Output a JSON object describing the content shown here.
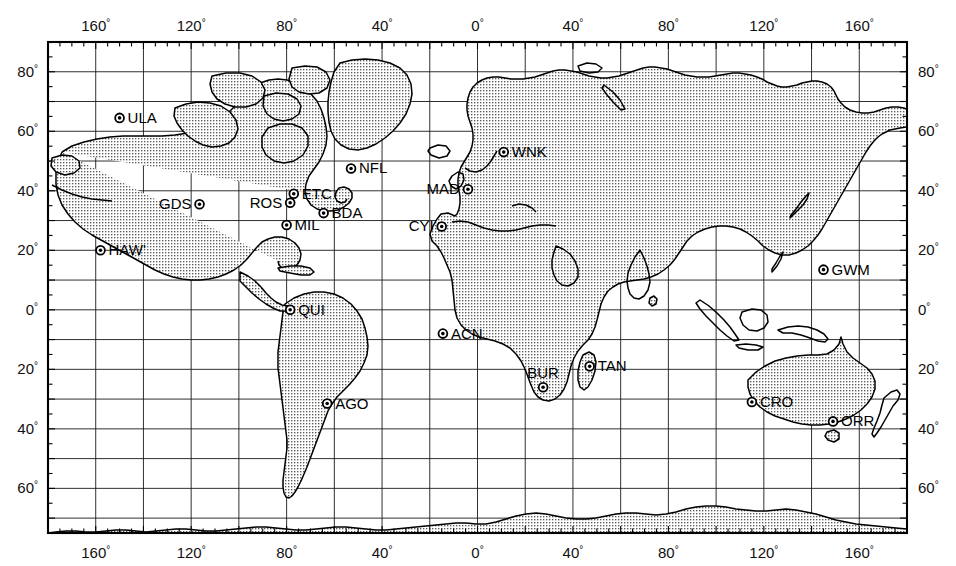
{
  "figure": {
    "type": "world-map",
    "projection": "equirectangular",
    "title": "",
    "background_color": "#ffffff",
    "land_fill_pattern": "stipple",
    "line_color": "#000000"
  },
  "axes": {
    "x_label_suffix": "°",
    "y_label_suffix": "°",
    "x_range": [
      -180,
      180
    ],
    "y_range": [
      -75,
      90
    ],
    "x_gridline_interval_deg": 20,
    "x_major_label_interval_deg": 40,
    "y_gridline_interval_deg": 10,
    "y_major_label_interval_deg": 20,
    "minor_tick_interval_deg": 5,
    "top_labels": [
      "160",
      "120",
      "80",
      "40",
      "0",
      "40",
      "80",
      "120",
      "160"
    ],
    "bottom_labels": [
      "160",
      "120",
      "80",
      "40",
      "0",
      "40",
      "80",
      "120",
      "160"
    ],
    "left_labels": [
      "80",
      "60",
      "40",
      "20",
      "0",
      "20",
      "40",
      "60"
    ],
    "right_labels": [
      "80",
      "60",
      "40",
      "20",
      "0",
      "20",
      "40",
      "60"
    ],
    "top_label_values": [
      -160,
      -120,
      -80,
      -40,
      0,
      40,
      80,
      120,
      160
    ],
    "bottom_label_values": [
      -160,
      -120,
      -80,
      -40,
      0,
      40,
      80,
      120,
      160
    ],
    "left_label_values": [
      80,
      60,
      40,
      20,
      0,
      -20,
      -40,
      -60
    ],
    "right_label_values": [
      80,
      60,
      40,
      20,
      0,
      -20,
      -40,
      -60
    ]
  },
  "stations": [
    {
      "code": "ULA",
      "lon": -150.0,
      "lat": 64.5,
      "label_side": "right",
      "marker": "ring-dot"
    },
    {
      "code": "NFL",
      "lon": -53.0,
      "lat": 47.5,
      "label_side": "right",
      "marker": "ring-dot"
    },
    {
      "code": "ETC",
      "lon": -77.0,
      "lat": 39.0,
      "label_side": "right",
      "marker": "ring-dot"
    },
    {
      "code": "ROS",
      "lon": -78.5,
      "lat": 36.0,
      "label_side": "left",
      "marker": "ring-dot"
    },
    {
      "code": "BDA",
      "lon": -64.5,
      "lat": 32.5,
      "label_side": "right",
      "marker": "ring-dot"
    },
    {
      "code": "MIL",
      "lon": -80.0,
      "lat": 28.5,
      "label_side": "right",
      "marker": "ring-dot"
    },
    {
      "code": "GDS",
      "lon": -116.5,
      "lat": 35.5,
      "label_side": "left",
      "marker": "ring-dot"
    },
    {
      "code": "HAW'",
      "lon": -158.0,
      "lat": 20.0,
      "label_side": "right",
      "marker": "ring-dot"
    },
    {
      "code": "QUI",
      "lon": -78.5,
      "lat": 0.0,
      "label_side": "right",
      "marker": "ring-dot"
    },
    {
      "code": "AGO",
      "lon": -63.0,
      "lat": -31.5,
      "label_side": "right",
      "marker": "ring-dot"
    },
    {
      "code": "ACN",
      "lon": -14.5,
      "lat": -8.0,
      "label_side": "right",
      "marker": "ring-dot"
    },
    {
      "code": "WNK",
      "lon": 11.0,
      "lat": 53.0,
      "label_side": "right",
      "marker": "ring-dot"
    },
    {
      "code": "MAD",
      "lon": -4.0,
      "lat": 40.5,
      "label_side": "left",
      "marker": "ring-dot"
    },
    {
      "code": "CYI",
      "lon": -15.0,
      "lat": 28.0,
      "label_side": "left",
      "marker": "ring-dot"
    },
    {
      "code": "BUR",
      "lon": 27.5,
      "lat": -26.0,
      "label_side": "above",
      "marker": "ring-dot"
    },
    {
      "code": "TAN",
      "lon": 47.0,
      "lat": -19.0,
      "label_side": "right",
      "marker": "ring-dot"
    },
    {
      "code": "GWM",
      "lon": 145.0,
      "lat": 13.5,
      "label_side": "right",
      "marker": "ring-dot"
    },
    {
      "code": "CRO",
      "lon": 115.0,
      "lat": -31.0,
      "label_side": "right",
      "marker": "ring-dot"
    },
    {
      "code": "ORR",
      "lon": 149.0,
      "lat": -37.5,
      "label_side": "right",
      "marker": "ring-dot"
    }
  ],
  "chart_data": {
    "type": "scatter",
    "title": "",
    "xlabel": "Longitude (degrees)",
    "ylabel": "Latitude (degrees)",
    "xlim": [
      -180,
      180
    ],
    "ylim": [
      -75,
      90
    ],
    "grid": true,
    "legend": "none",
    "series": [
      {
        "name": "Tracking stations",
        "points": [
          {
            "label": "ULA",
            "x": -150.0,
            "y": 64.5
          },
          {
            "label": "NFL",
            "x": -53.0,
            "y": 47.5
          },
          {
            "label": "ETC",
            "x": -77.0,
            "y": 39.0
          },
          {
            "label": "ROS",
            "x": -78.5,
            "y": 36.0
          },
          {
            "label": "BDA",
            "x": -64.5,
            "y": 32.5
          },
          {
            "label": "MIL",
            "x": -80.0,
            "y": 28.5
          },
          {
            "label": "GDS",
            "x": -116.5,
            "y": 35.5
          },
          {
            "label": "HAW'",
            "x": -158.0,
            "y": 20.0
          },
          {
            "label": "QUI",
            "x": -78.5,
            "y": 0.0
          },
          {
            "label": "AGO",
            "x": -63.0,
            "y": -31.5
          },
          {
            "label": "ACN",
            "x": -14.5,
            "y": -8.0
          },
          {
            "label": "WNK",
            "x": 11.0,
            "y": 53.0
          },
          {
            "label": "MAD",
            "x": -4.0,
            "y": 40.5
          },
          {
            "label": "CYI",
            "x": -15.0,
            "y": 28.0
          },
          {
            "label": "BUR",
            "x": 27.5,
            "y": -26.0
          },
          {
            "label": "TAN",
            "x": 47.0,
            "y": -19.0
          },
          {
            "label": "GWM",
            "x": 145.0,
            "y": 13.5
          },
          {
            "label": "CRO",
            "x": 115.0,
            "y": -31.0
          },
          {
            "label": "ORR",
            "x": 149.0,
            "y": -37.5
          }
        ]
      }
    ]
  }
}
